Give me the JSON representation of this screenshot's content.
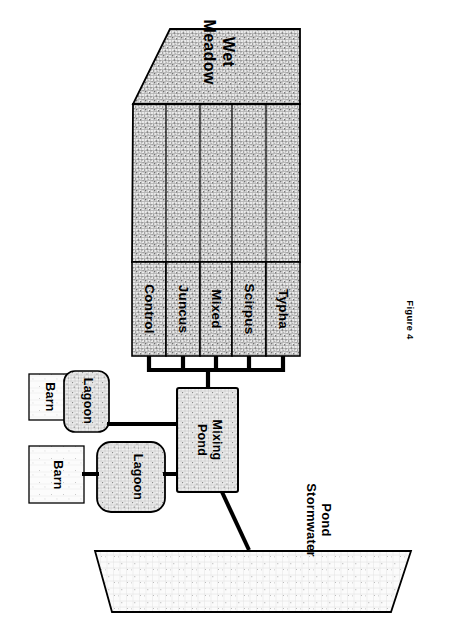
{
  "figure": {
    "caption": "Figure 4",
    "title_hidden": ""
  },
  "wetland": {
    "meadow_label_line1": "Wet",
    "meadow_label_line2": "Meadow",
    "strips": [
      {
        "label": "Control"
      },
      {
        "label": "Juncus"
      },
      {
        "label": "Mixed"
      },
      {
        "label": "Scirpus"
      },
      {
        "label": "Typha"
      }
    ]
  },
  "facility": {
    "barn_upper": "Barn",
    "barn_lower": "Barn",
    "lagoon_upper": "Lagoon",
    "lagoon_lower": "Lagoon",
    "mixing_pond_line1": "Mixing",
    "mixing_pond_line2": "Pond",
    "stormwater_pond_line1": "Stormwater",
    "stormwater_pond_line2": "Pond"
  },
  "colors": {
    "ink": "#000000",
    "paper": "#ffffff",
    "texture_dark": "#8c8c8c",
    "texture_light": "#d8d8d8"
  }
}
